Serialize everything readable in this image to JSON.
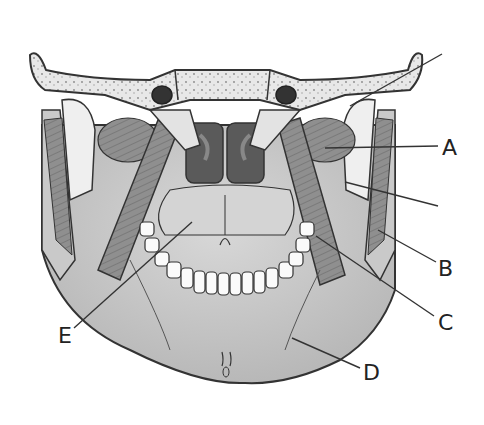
{
  "figure": {
    "labels": [
      {
        "id": "A",
        "text": "A",
        "x": 442,
        "y": 137
      },
      {
        "id": "B",
        "text": "B",
        "x": 438,
        "y": 258
      },
      {
        "id": "C",
        "text": "C",
        "x": 438,
        "y": 312
      },
      {
        "id": "D",
        "text": "D",
        "x": 363,
        "y": 362
      },
      {
        "id": "E",
        "text": "E",
        "x": 58,
        "y": 325
      }
    ],
    "unlabeled_pointers": 2,
    "colors": {
      "bone": "#e6e6e6",
      "muscle": "#8c8c8c",
      "dark": "#4a4a4a",
      "line": "#333333"
    }
  }
}
